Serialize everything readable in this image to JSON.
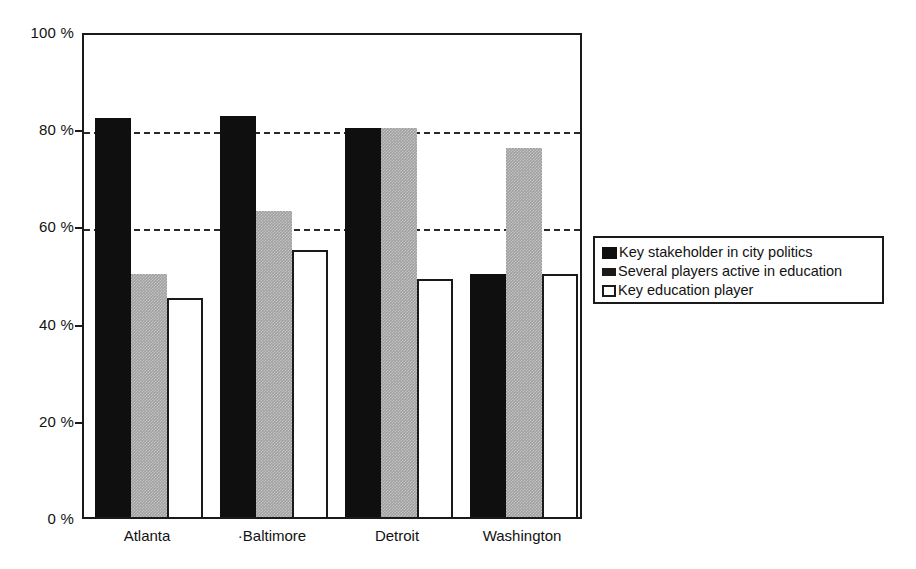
{
  "chart_data": {
    "type": "bar",
    "title": "",
    "subtitle": "",
    "xlabel": "",
    "ylabel": "",
    "categories": [
      "Atlanta",
      "·Baltimore",
      "Detroit",
      "Washington"
    ],
    "series": [
      {
        "name": "Key stakeholder in city politics",
        "color": "#0f0f0f",
        "swatch": "solid-black-square",
        "values": [
          82,
          82.5,
          80,
          50
        ]
      },
      {
        "name": "Several players active in education",
        "color": "#a0a0a0",
        "swatch": "small-dark-square",
        "values": [
          50,
          63,
          80,
          76
        ]
      },
      {
        "name": "Key education player",
        "color": "#ffffff",
        "swatch": "white-outlined-square",
        "values": [
          45,
          55,
          49,
          50
        ]
      }
    ],
    "ylim": [
      0,
      100
    ],
    "ytick_values": [
      0,
      20,
      40,
      60,
      80,
      100
    ],
    "ytick_labels": [
      "0 %",
      "20 %",
      "40 %",
      "60 %",
      "80 %",
      "100 %"
    ],
    "gridlines": {
      "enabled": true,
      "style": "dashed",
      "at_values": [
        60,
        80
      ]
    },
    "legend": {
      "position": "right",
      "entries": [
        "Key stakeholder in city politics",
        "Several players active in education",
        "Key education player"
      ]
    },
    "axis_color": "#1a1a1a",
    "background": "#ffffff"
  }
}
